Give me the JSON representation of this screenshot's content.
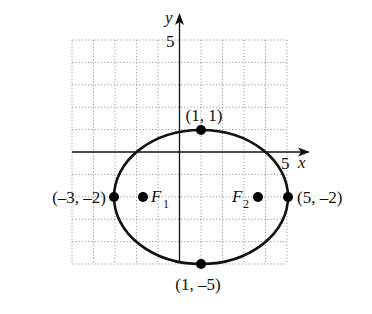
{
  "figure": {
    "type": "ellipse-graph",
    "axes": {
      "x_label": "x",
      "y_label": "y",
      "x_tick_label": "5",
      "y_tick_label": "5",
      "x_range": [
        -5,
        5
      ],
      "y_range": [
        -5,
        5
      ],
      "grid": true
    },
    "ellipse": {
      "center": [
        1,
        -2
      ],
      "semi_major_horizontal": 4,
      "semi_minor_vertical": 3
    },
    "points": [
      {
        "id": "top",
        "coords": [
          1,
          1
        ],
        "label": "(1, 1)"
      },
      {
        "id": "bottom",
        "coords": [
          1,
          -5
        ],
        "label": "(1, –5)"
      },
      {
        "id": "left",
        "coords": [
          -3,
          -2
        ],
        "label": "(–3, –2)"
      },
      {
        "id": "right",
        "coords": [
          5,
          -2
        ],
        "label": "(5, –2)"
      }
    ],
    "foci": [
      {
        "id": "F1",
        "name": "F",
        "subscript": "1"
      },
      {
        "id": "F2",
        "name": "F",
        "subscript": "2"
      }
    ],
    "colors": {
      "curve": "#111111",
      "grid": "#9a9a9a",
      "background": "#ffffff"
    }
  }
}
